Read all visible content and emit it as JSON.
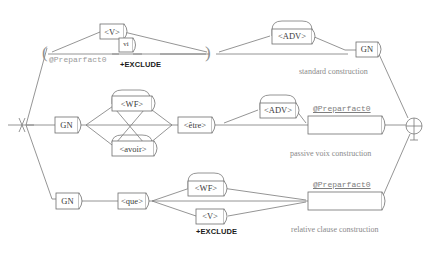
{
  "diagram": {
    "type": "grammar-graph",
    "title_visible": false,
    "colors": {
      "line": "#7a7a7a",
      "box_stroke": "#6e6e6e",
      "node_text": "#3a3a3a",
      "caption_text": "#8a8a8a",
      "subgraph_text": "#7d7d7d",
      "exclude_text": "#1a1a1a",
      "background": "#ffffff"
    },
    "start_marker": {
      "name": "start-terminal",
      "glyph": "crossed-line"
    },
    "end_marker": {
      "name": "end-terminal",
      "glyph": "circle-plus"
    },
    "paths": [
      {
        "id": "standard",
        "caption": "standard construction",
        "nodes": [
          {
            "id": "v-top",
            "label": "<V>",
            "shape": "box",
            "exclude": false
          },
          {
            "id": "vi-top",
            "label": "vi",
            "shape": "box-round-right",
            "exclude": true
          },
          {
            "id": "adv-top",
            "label": "<ADV>",
            "shape": "box-loop",
            "exclude": false
          },
          {
            "id": "gn-top",
            "label": "GN",
            "shape": "box-round-right",
            "exclude": false
          }
        ],
        "subgraph_ref": "@Preparfact0"
      },
      {
        "id": "passive",
        "caption": "passive voix construction",
        "nodes": [
          {
            "id": "gn-mid",
            "label": "GN",
            "shape": "box-round-right",
            "exclude": false
          },
          {
            "id": "wf-mid",
            "label": "<WF>",
            "shape": "box-loop",
            "exclude": false
          },
          {
            "id": "avoir-mid",
            "label": "<avoir>",
            "shape": "box-loop-below",
            "exclude": false
          },
          {
            "id": "etre-mid",
            "label": "<être>",
            "shape": "box-round-right",
            "exclude": false
          },
          {
            "id": "adv-mid",
            "label": "<ADV>",
            "shape": "box-loop",
            "exclude": false
          },
          {
            "id": "preparfact-mid",
            "label": "@Preparfact0",
            "shape": "wide-box",
            "exclude": false
          }
        ],
        "subgraph_ref": "@Preparfact0"
      },
      {
        "id": "relative",
        "caption": "relative clause construction",
        "nodes": [
          {
            "id": "gn-bot",
            "label": "GN",
            "shape": "box-round-right",
            "exclude": false
          },
          {
            "id": "que-bot",
            "label": "<que>",
            "shape": "box-round-right",
            "exclude": false
          },
          {
            "id": "wf-bot",
            "label": "<WF>",
            "shape": "box-loop",
            "exclude": false
          },
          {
            "id": "v-bot",
            "label": "<V>",
            "shape": "box-round-right",
            "exclude": true
          },
          {
            "id": "preparfact-bot",
            "label": "@Preparfact0",
            "shape": "wide-box",
            "exclude": false
          }
        ],
        "subgraph_ref": "@Preparfact0"
      }
    ],
    "labels": {
      "v_top": "<V>",
      "vi_top": "vi",
      "adv_top": "<ADV>",
      "gn_top": "GN",
      "preparfact_top": "@Preparfact0",
      "exclude_top": "+EXCLUDE",
      "caption_top": "standard construction",
      "gn_mid": "GN",
      "wf_mid": "<WF>",
      "avoir_mid": "<avoir>",
      "etre_mid": "<être>",
      "adv_mid": "<ADV>",
      "preparfact_mid": "@Preparfact0",
      "caption_mid": "passive voix construction",
      "gn_bot": "GN",
      "que_bot": "<que>",
      "wf_bot": "<WF>",
      "v_bot": "<V>",
      "exclude_bot": "+EXCLUDE",
      "preparfact_bot": "@Preparfact0",
      "caption_bot": "relative clause construction",
      "paren_open": "(",
      "paren_close": ")"
    }
  }
}
